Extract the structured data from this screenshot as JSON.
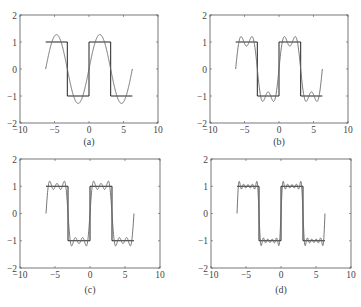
{
  "chart_data": [
    {
      "type": "line",
      "panel": "a",
      "caption": "(a)",
      "title": "",
      "xlabel": "",
      "ylabel": "",
      "xlim": [
        -10,
        10
      ],
      "ylim": [
        -2,
        2
      ],
      "xticks": [
        -10,
        -5,
        0,
        5,
        10
      ],
      "yticks": [
        -2,
        -1,
        0,
        1,
        2
      ],
      "grid": false,
      "legend": null,
      "series": [
        {
          "name": "square wave",
          "description": "Square wave, period 2π, amplitude 1, over x in [-2π, 2π]",
          "x": [
            -6.283,
            -3.1416,
            -3.1416,
            0,
            0,
            3.1416,
            3.1416,
            6.283
          ],
          "y": [
            1,
            1,
            -1,
            -1,
            1,
            1,
            -1,
            -1
          ]
        },
        {
          "name": "Fourier approximation",
          "harmonics": [
            1
          ],
          "description": "(4/π)·sin(x)"
        }
      ]
    },
    {
      "type": "line",
      "panel": "b",
      "caption": "(b)",
      "xlim": [
        -10,
        10
      ],
      "ylim": [
        -2,
        2
      ],
      "xticks": [
        -10,
        -5,
        0,
        5,
        10
      ],
      "yticks": [
        -2,
        -1,
        0,
        1,
        2
      ],
      "grid": false,
      "series": [
        {
          "name": "square wave",
          "x": [
            -6.283,
            -3.1416,
            -3.1416,
            0,
            0,
            3.1416,
            3.1416,
            6.283
          ],
          "y": [
            1,
            1,
            -1,
            -1,
            1,
            1,
            -1,
            -1
          ]
        },
        {
          "name": "Fourier approximation",
          "harmonics": [
            1,
            3
          ],
          "description": "(4/π)·Σ sin(kx)/k, k = 1,3"
        }
      ]
    },
    {
      "type": "line",
      "panel": "c",
      "caption": "(c)",
      "xlim": [
        -10,
        10
      ],
      "ylim": [
        -2,
        2
      ],
      "xticks": [
        -10,
        -5,
        0,
        5,
        10
      ],
      "yticks": [
        -2,
        -1,
        0,
        1,
        2
      ],
      "grid": false,
      "series": [
        {
          "name": "square wave",
          "x": [
            -6.283,
            -3.1416,
            -3.1416,
            0,
            0,
            3.1416,
            3.1416,
            6.283
          ],
          "y": [
            1,
            1,
            -1,
            -1,
            1,
            1,
            -1,
            -1
          ]
        },
        {
          "name": "Fourier approximation",
          "harmonics": [
            1,
            3,
            5
          ],
          "description": "(4/π)·Σ sin(kx)/k, k = 1,3,5"
        }
      ]
    },
    {
      "type": "line",
      "panel": "d",
      "caption": "(d)",
      "xlim": [
        -10,
        10
      ],
      "ylim": [
        -2,
        2
      ],
      "xticks": [
        -10,
        -5,
        0,
        5,
        10
      ],
      "yticks": [
        -2,
        -1,
        0,
        1,
        2
      ],
      "grid": false,
      "series": [
        {
          "name": "square wave",
          "x": [
            -6.283,
            -3.1416,
            -3.1416,
            0,
            0,
            3.1416,
            3.1416,
            6.283
          ],
          "y": [
            1,
            1,
            -1,
            -1,
            1,
            1,
            -1,
            -1
          ]
        },
        {
          "name": "Fourier approximation",
          "harmonics": [
            1,
            3,
            5,
            7,
            9
          ],
          "description": "(4/π)·Σ sin(kx)/k, k = 1,3,5,7,9"
        }
      ]
    }
  ],
  "panels": [
    {
      "id": "a",
      "caption": "(a)",
      "box": [
        20,
        15,
        158,
        123
      ]
    },
    {
      "id": "b",
      "caption": "(b)",
      "box": [
        210,
        15,
        348,
        123
      ]
    },
    {
      "id": "c",
      "caption": "(c)",
      "box": [
        20,
        159,
        160,
        268
      ]
    },
    {
      "id": "d",
      "caption": "(d)",
      "box": [
        211,
        159,
        351,
        268
      ]
    }
  ],
  "colors": {
    "axes": "#555555",
    "square": "#222222",
    "approx": "#666666"
  }
}
